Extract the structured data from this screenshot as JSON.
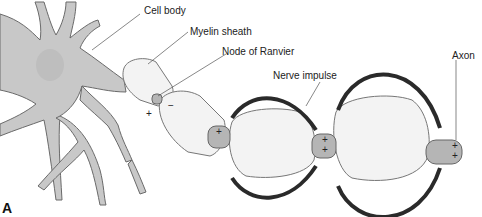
{
  "diagram": {
    "labels": {
      "cell_body": "Cell body",
      "myelin_sheath": "Myelin sheath",
      "node_of_ranvier": "Node of Ranvier",
      "nerve_impulse": "Nerve impulse",
      "axon": "Axon"
    },
    "panel_letter": "A",
    "charges": {
      "plus": "+",
      "minus": "−"
    },
    "colors": {
      "cell_fill": "#c8c8c8",
      "cell_stroke": "#6a6a6a",
      "myelin_fill": "#f3f3f3",
      "node_fill": "#b5b5b5",
      "arrow": "#2a2a2a"
    }
  }
}
